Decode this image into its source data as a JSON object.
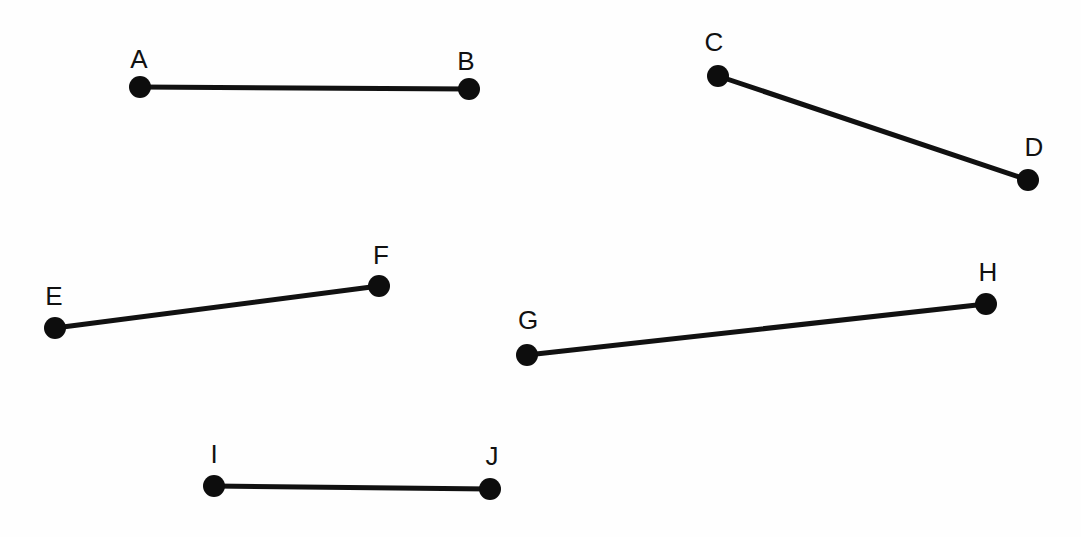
{
  "diagram": {
    "type": "line-segments",
    "canvas": {
      "width": 1081,
      "height": 537
    },
    "colors": {
      "line": "#111111",
      "point": "#0d0d0d",
      "label": "#111111",
      "background": "#fefefe"
    },
    "points": {
      "A": {
        "label": "A",
        "x": 140,
        "y": 87,
        "label_x": 139,
        "label_y": 68
      },
      "B": {
        "label": "B",
        "x": 469,
        "y": 89,
        "label_x": 466,
        "label_y": 70
      },
      "C": {
        "label": "C",
        "x": 718,
        "y": 76,
        "label_x": 714,
        "label_y": 51
      },
      "D": {
        "label": "D",
        "x": 1028,
        "y": 180,
        "label_x": 1034,
        "label_y": 156
      },
      "E": {
        "label": "E",
        "x": 55,
        "y": 328,
        "label_x": 54,
        "label_y": 305
      },
      "F": {
        "label": "F",
        "x": 379,
        "y": 286,
        "label_x": 381,
        "label_y": 264
      },
      "G": {
        "label": "G",
        "x": 527,
        "y": 355,
        "label_x": 528,
        "label_y": 329
      },
      "H": {
        "label": "H",
        "x": 986,
        "y": 304,
        "label_x": 988,
        "label_y": 281
      },
      "I": {
        "label": "I",
        "x": 214,
        "y": 486,
        "label_x": 214,
        "label_y": 463
      },
      "J": {
        "label": "J",
        "x": 490,
        "y": 489,
        "label_x": 492,
        "label_y": 465
      }
    },
    "segments": [
      {
        "name": "AB",
        "from": "A",
        "to": "B"
      },
      {
        "name": "CD",
        "from": "C",
        "to": "D"
      },
      {
        "name": "EF",
        "from": "E",
        "to": "F"
      },
      {
        "name": "GH",
        "from": "G",
        "to": "H"
      },
      {
        "name": "IJ",
        "from": "I",
        "to": "J"
      }
    ]
  }
}
